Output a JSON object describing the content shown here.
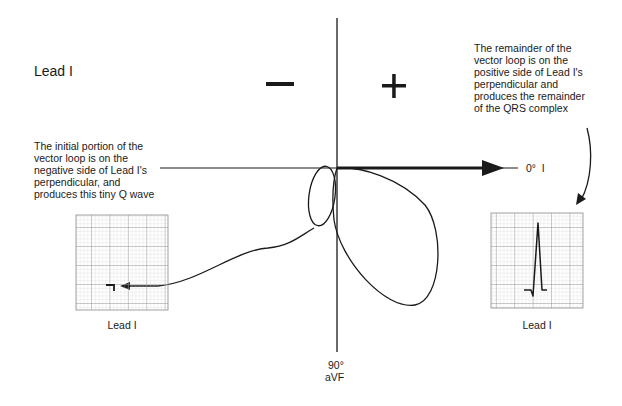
{
  "title": "Lead I",
  "signs": {
    "negative": "−",
    "positive": "+"
  },
  "axes": {
    "horizontal_label": "0°  I",
    "vertical_label_deg": "90°",
    "vertical_label_lead": "aVF"
  },
  "annotations": {
    "left": [
      "The initial portion of the",
      "vector loop is on the",
      "negative side of Lead I's",
      "perpendicular, and",
      "produces this tiny Q wave"
    ],
    "right": [
      "The remainder of the",
      "vector loop is on the",
      "positive side of Lead I's",
      "perpendicular and",
      "produces the remainder",
      "of the QRS complex"
    ]
  },
  "ecg_strips": {
    "left": {
      "label": "Lead I",
      "content": "tiny Q wave"
    },
    "right": {
      "label": "Lead I",
      "content": "QRS complex (small q, tall R)"
    }
  },
  "colors": {
    "ink": "#1a1a1a",
    "grid_minor": "#c8c8c8",
    "grid_major": "#8a8a8a",
    "background": "#ffffff"
  }
}
